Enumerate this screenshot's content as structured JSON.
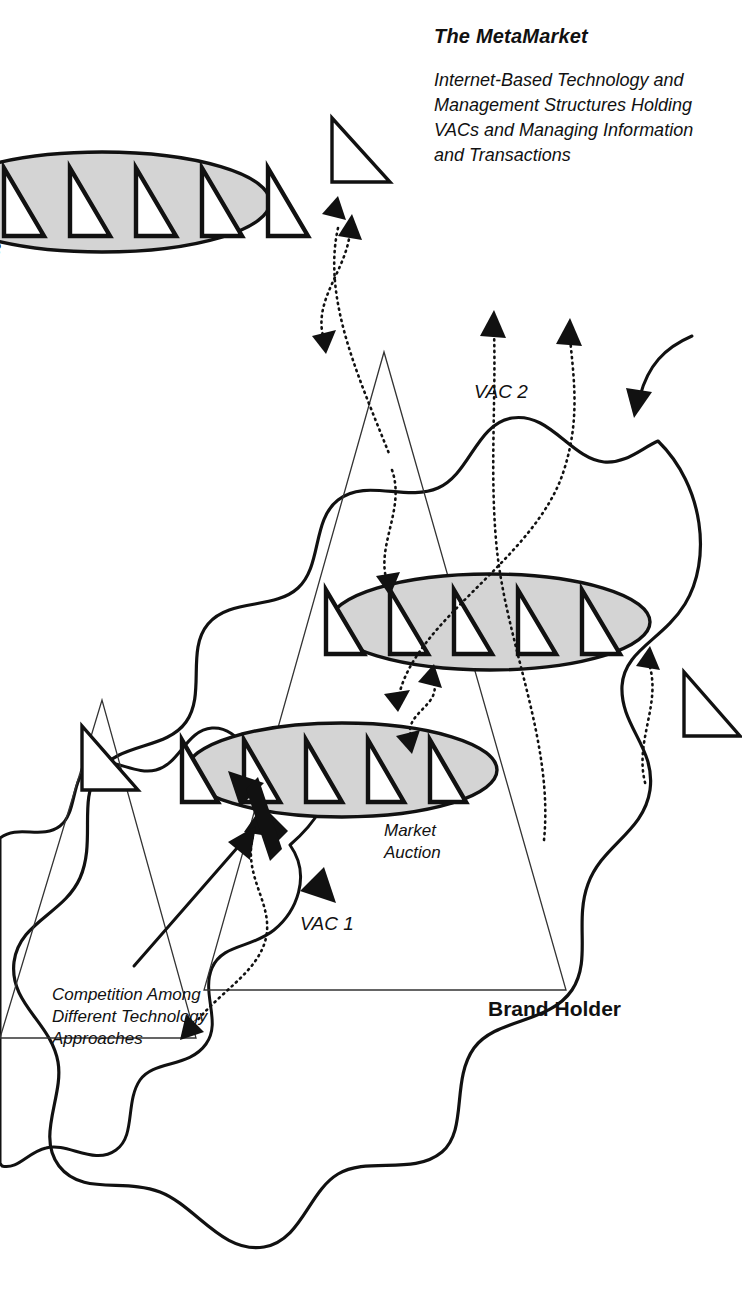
{
  "diagram": {
    "title": "The MetaMarket",
    "subtitle_lines": [
      "Internet-Based Technology and",
      "Management Structures Holding",
      "VACs and Managing Information",
      "and Transactions"
    ],
    "labels": {
      "vac1": "VAC 1",
      "vac2": "VAC 2",
      "vac3": "VAC 3",
      "brand_holder": "Brand Holder",
      "market_auction_lines": [
        "Market",
        "Auction"
      ],
      "competition_lines": [
        "Competition Among",
        "Different Technology",
        "Approaches"
      ]
    },
    "colors": {
      "ink": "#111111",
      "vac_fill": "#d4d4d4",
      "background": "#ffffff",
      "thin_line": "#333333"
    },
    "counts": {
      "triangles_per_vac": 5,
      "vac_clusters": 3,
      "external_triangles": 3
    }
  }
}
